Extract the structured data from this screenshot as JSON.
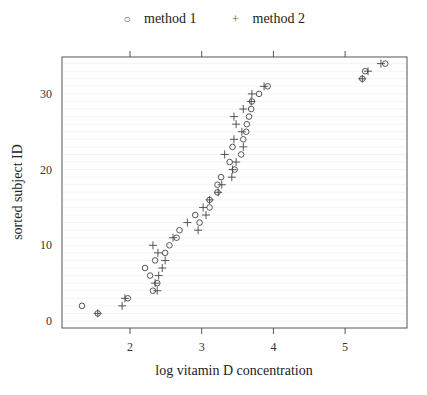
{
  "legend": {
    "items": [
      {
        "label": "method 1",
        "symbol": "circle-icon",
        "glyph": "○"
      },
      {
        "label": "method 2",
        "symbol": "plus-icon",
        "glyph": "+"
      }
    ]
  },
  "axes": {
    "xlabel": "log vitamin D concentration",
    "ylabel": "sorted subject ID",
    "xticks": [
      "2",
      "3",
      "4",
      "5"
    ],
    "yticks": [
      "0",
      "10",
      "20",
      "30"
    ]
  },
  "chart_data": {
    "type": "scatter",
    "title": "",
    "xlabel": "log vitamin D concentration",
    "ylabel": "sorted subject ID",
    "xlim": [
      1.15,
      5.7
    ],
    "ylim": [
      -0.9,
      35
    ],
    "x_ticks": [
      2,
      3,
      4,
      5
    ],
    "y_ticks": [
      0,
      10,
      20,
      30
    ],
    "grid": "horizontal lines at each subject ID (faint)",
    "legend_position": "top",
    "series": [
      {
        "name": "method 1",
        "marker": "circle",
        "points": [
          [
            1.55,
            1
          ],
          [
            1.33,
            2
          ],
          [
            1.97,
            3
          ],
          [
            2.32,
            4
          ],
          [
            2.38,
            5
          ],
          [
            2.28,
            6
          ],
          [
            2.21,
            7
          ],
          [
            2.35,
            8
          ],
          [
            2.49,
            9
          ],
          [
            2.55,
            10
          ],
          [
            2.65,
            11
          ],
          [
            2.69,
            12
          ],
          [
            2.97,
            13
          ],
          [
            2.91,
            14
          ],
          [
            3.11,
            15
          ],
          [
            3.11,
            16
          ],
          [
            3.22,
            17
          ],
          [
            3.22,
            18
          ],
          [
            3.27,
            19
          ],
          [
            3.46,
            20
          ],
          [
            3.39,
            21
          ],
          [
            3.55,
            22
          ],
          [
            3.43,
            23
          ],
          [
            3.58,
            24
          ],
          [
            3.62,
            25
          ],
          [
            3.63,
            26
          ],
          [
            3.66,
            27
          ],
          [
            3.69,
            28
          ],
          [
            3.7,
            29
          ],
          [
            3.8,
            30
          ],
          [
            3.92,
            31
          ],
          [
            5.24,
            32
          ],
          [
            5.28,
            33
          ],
          [
            5.56,
            34
          ]
        ]
      },
      {
        "name": "method 2",
        "marker": "plus",
        "points": [
          [
            1.55,
            1
          ],
          [
            1.89,
            2
          ],
          [
            1.93,
            3
          ],
          [
            2.38,
            4
          ],
          [
            2.35,
            5
          ],
          [
            2.4,
            6
          ],
          [
            2.45,
            7
          ],
          [
            2.49,
            8
          ],
          [
            2.39,
            9
          ],
          [
            2.32,
            10
          ],
          [
            2.6,
            11
          ],
          [
            2.95,
            12
          ],
          [
            2.8,
            13
          ],
          [
            3.06,
            14
          ],
          [
            3.02,
            15
          ],
          [
            3.11,
            16
          ],
          [
            3.23,
            17
          ],
          [
            3.28,
            18
          ],
          [
            3.42,
            19
          ],
          [
            3.43,
            20
          ],
          [
            3.48,
            21
          ],
          [
            3.32,
            22
          ],
          [
            3.58,
            23
          ],
          [
            3.45,
            24
          ],
          [
            3.56,
            25
          ],
          [
            3.48,
            26
          ],
          [
            3.45,
            27
          ],
          [
            3.58,
            28
          ],
          [
            3.69,
            29
          ],
          [
            3.7,
            30
          ],
          [
            3.87,
            31
          ],
          [
            5.24,
            32
          ],
          [
            5.32,
            33
          ],
          [
            5.5,
            34
          ]
        ]
      }
    ]
  }
}
